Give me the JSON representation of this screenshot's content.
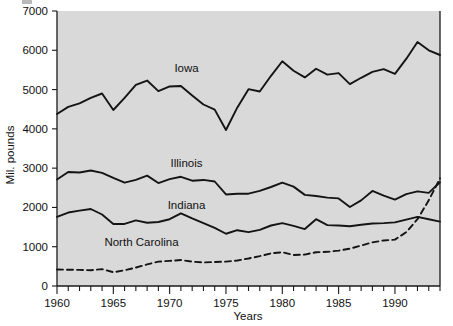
{
  "chart_data": {
    "type": "line",
    "title": "",
    "xlabel": "Years",
    "ylabel": "Mil. pounds",
    "xlim": [
      1960,
      1994
    ],
    "ylim": [
      0,
      7000
    ],
    "grid": false,
    "legend_position": "inline-labels",
    "x_tick_labels": [
      "1960",
      "1965",
      "1970",
      "1975",
      "1980",
      "1985",
      "1990"
    ],
    "x_tick_values": [
      1960,
      1965,
      1970,
      1975,
      1980,
      1985,
      1990
    ],
    "x_minor_tick_step": 1,
    "y_tick_labels": [
      "0",
      "1000",
      "2000",
      "3000",
      "4000",
      "5000",
      "6000",
      "7000"
    ],
    "y_tick_values": [
      0,
      1000,
      2000,
      3000,
      4000,
      5000,
      6000,
      7000
    ],
    "x": [
      1960,
      1961,
      1962,
      1963,
      1964,
      1965,
      1966,
      1967,
      1968,
      1969,
      1970,
      1971,
      1972,
      1973,
      1974,
      1975,
      1976,
      1977,
      1978,
      1979,
      1980,
      1981,
      1982,
      1983,
      1984,
      1985,
      1986,
      1987,
      1988,
      1989,
      1990,
      1991,
      1992,
      1993,
      1994
    ],
    "series": [
      {
        "name": "Iowa",
        "style": "solid",
        "color": "#141414",
        "label_x": 1971.5,
        "label_y": 5450,
        "values": [
          4380,
          4560,
          4650,
          4790,
          4900,
          4480,
          4790,
          5120,
          5230,
          4960,
          5080,
          5090,
          4850,
          4620,
          4490,
          3970,
          4540,
          5010,
          4950,
          5350,
          5720,
          5480,
          5310,
          5530,
          5380,
          5420,
          5140,
          5300,
          5450,
          5520,
          5400,
          5780,
          6210,
          6000,
          5880
        ]
      },
      {
        "name": "Illinois",
        "style": "solid",
        "color": "#141414",
        "label_x": 1971.5,
        "label_y": 3030,
        "values": [
          2710,
          2900,
          2890,
          2940,
          2880,
          2750,
          2630,
          2700,
          2810,
          2620,
          2720,
          2780,
          2680,
          2700,
          2660,
          2330,
          2350,
          2350,
          2420,
          2520,
          2630,
          2530,
          2320,
          2290,
          2250,
          2230,
          2010,
          2180,
          2420,
          2300,
          2200,
          2340,
          2410,
          2370,
          2640
        ]
      },
      {
        "name": "Indiana",
        "style": "solid",
        "color": "#141414",
        "label_x": 1971.5,
        "label_y": 1960,
        "values": [
          1760,
          1870,
          1920,
          1960,
          1820,
          1580,
          1580,
          1670,
          1610,
          1630,
          1700,
          1850,
          1720,
          1600,
          1480,
          1330,
          1420,
          1370,
          1430,
          1540,
          1600,
          1530,
          1450,
          1700,
          1550,
          1540,
          1520,
          1560,
          1590,
          1600,
          1620,
          1690,
          1760,
          1700,
          1640
        ]
      },
      {
        "name": "North Carolina",
        "style": "dashed",
        "color": "#141414",
        "label_x": 1967.5,
        "label_y": 1030,
        "values": [
          420,
          415,
          410,
          400,
          430,
          350,
          400,
          470,
          550,
          620,
          640,
          660,
          620,
          600,
          610,
          620,
          650,
          700,
          760,
          830,
          860,
          790,
          800,
          860,
          870,
          900,
          950,
          1030,
          1110,
          1160,
          1180,
          1370,
          1700,
          2180,
          2740
        ]
      }
    ]
  },
  "axes": {
    "x_label": "Years",
    "y_label": "Mil. pounds"
  }
}
